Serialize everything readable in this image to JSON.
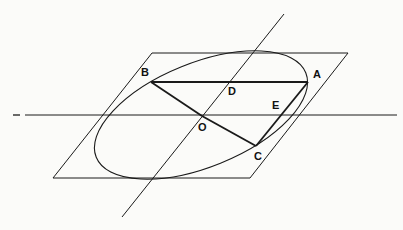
{
  "figure": {
    "canvas": {
      "width": 403,
      "height": 230
    },
    "background_color": "#fbfbf9",
    "stroke_color": "#1a1a1a",
    "thin_stroke_width": 1.0,
    "thick_stroke_width": 1.9,
    "plane": {
      "name": "parallelogram-plane",
      "points": "152,53 348,53 250,178 53,178"
    },
    "horizontal_line": {
      "name": "horizontal-trace-line",
      "x1": 25,
      "y1": 115,
      "x2": 397,
      "y2": 115
    },
    "horizontal_line_dash": {
      "name": "horizontal-trace-dash",
      "x1": 13,
      "y1": 115,
      "x2": 20,
      "y2": 115
    },
    "oblique_line": {
      "name": "oblique-axis-line",
      "x1": 122,
      "y1": 217,
      "x2": 284,
      "y2": 14
    },
    "ellipse": {
      "name": "inscribed-ellipse",
      "cx": 201,
      "cy": 115,
      "rx": 113,
      "ry": 52,
      "rotation_deg": -22
    },
    "segments": [
      {
        "name": "segment-BA",
        "x1": 151,
        "y1": 82,
        "x2": 308,
        "y2": 82
      },
      {
        "name": "segment-BO",
        "x1": 151,
        "y1": 82,
        "x2": 202,
        "y2": 116
      },
      {
        "name": "segment-OC",
        "x1": 202,
        "y1": 116,
        "x2": 256,
        "y2": 146
      },
      {
        "name": "segment-CA",
        "x1": 256,
        "y1": 146,
        "x2": 308,
        "y2": 82
      }
    ],
    "points": [
      {
        "id": "A",
        "label": "A",
        "x": 308,
        "y": 82,
        "label_x": 313,
        "label_y": 78
      },
      {
        "id": "B",
        "label": "B",
        "x": 151,
        "y": 82,
        "label_x": 141,
        "label_y": 76
      },
      {
        "id": "C",
        "label": "C",
        "x": 256,
        "y": 146,
        "label_x": 254,
        "label_y": 160
      },
      {
        "id": "D",
        "label": "D",
        "x": 232,
        "y": 82,
        "label_x": 228,
        "label_y": 95
      },
      {
        "id": "E",
        "label": "E",
        "x": 287,
        "y": 115,
        "label_x": 272,
        "label_y": 109
      },
      {
        "id": "O",
        "label": "O",
        "x": 202,
        "y": 116,
        "label_x": 198,
        "label_y": 131
      }
    ]
  }
}
